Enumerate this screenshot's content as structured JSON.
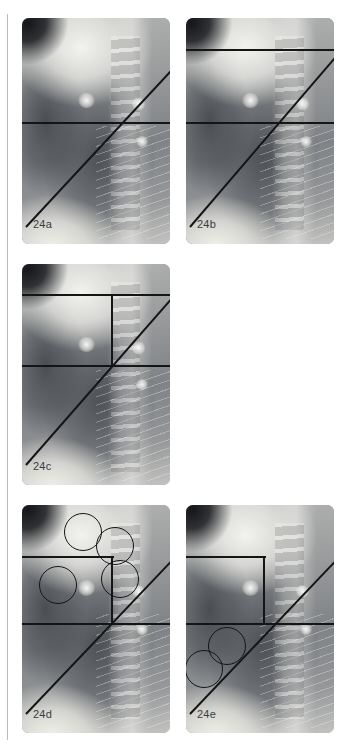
{
  "figure": {
    "type": "radiograph-annotation-series",
    "modality": "chest radiograph, lateral view",
    "panel_count": 5,
    "grid": {
      "columns": 2,
      "rows": 3
    },
    "background_color": "#ffffff",
    "annotation_color": "#151515",
    "label_color": "#3a3c3e"
  },
  "page_rule": {
    "name": "left-margin-rule",
    "color": "#b9bcbe",
    "x": 7,
    "y": 14,
    "width": 1,
    "height": 726
  },
  "panels": [
    {
      "id": "24a",
      "label": "24a",
      "x": 22,
      "y": 18,
      "width": 148,
      "height": 226,
      "label_x": 11,
      "label_y": 200,
      "annotations": {
        "horizontal_lines": [
          {
            "name": "lower-horizontal-line",
            "x1": -14,
            "y": 104,
            "x2": 162
          }
        ],
        "vertical_lines": [],
        "diagonal_lines": [
          {
            "name": "oblique-line",
            "x1": 4,
            "y1": 208,
            "x2": 160,
            "y2": 40
          }
        ],
        "circles": []
      }
    },
    {
      "id": "24b",
      "label": "24b",
      "x": 186,
      "y": 18,
      "width": 148,
      "height": 226,
      "label_x": 11,
      "label_y": 200,
      "annotations": {
        "horizontal_lines": [
          {
            "name": "upper-horizontal-line",
            "x1": -6,
            "y": 31,
            "x2": 162
          },
          {
            "name": "lower-horizontal-line",
            "x1": -6,
            "y": 104,
            "x2": 162
          }
        ],
        "vertical_lines": [],
        "diagonal_lines": [
          {
            "name": "oblique-line",
            "x1": 4,
            "y1": 208,
            "x2": 160,
            "y2": 26
          }
        ],
        "circles": []
      }
    },
    {
      "id": "24c",
      "label": "24c",
      "x": 22,
      "y": 264,
      "width": 148,
      "height": 221,
      "label_x": 11,
      "label_y": 196,
      "annotations": {
        "horizontal_lines": [
          {
            "name": "upper-horizontal-line",
            "x1": -6,
            "y": 30,
            "x2": 162
          },
          {
            "name": "lower-horizontal-line",
            "x1": -6,
            "y": 101,
            "x2": 162
          }
        ],
        "vertical_lines": [
          {
            "name": "rectangle-right-edge",
            "x": 89,
            "y1": 30,
            "y2": 103
          }
        ],
        "diagonal_lines": [
          {
            "name": "oblique-line",
            "x1": 4,
            "y1": 200,
            "x2": 158,
            "y2": 24
          }
        ],
        "circles": []
      }
    },
    {
      "id": "24d",
      "label": "24d",
      "x": 22,
      "y": 505,
      "width": 148,
      "height": 228,
      "label_x": 11,
      "label_y": 203,
      "annotations": {
        "horizontal_lines": [
          {
            "name": "rectangle-top-edge",
            "x1": -6,
            "y": 51,
            "x2": 92
          },
          {
            "name": "lower-horizontal-line",
            "x1": -6,
            "y": 118,
            "x2": 162
          }
        ],
        "vertical_lines": [
          {
            "name": "rectangle-right-edge",
            "x": 89,
            "y1": 51,
            "y2": 120
          }
        ],
        "diagonal_lines": [
          {
            "name": "oblique-line",
            "x1": 4,
            "y1": 208,
            "x2": 160,
            "y2": 44
          }
        ],
        "circles": [
          {
            "name": "roi-circle-1",
            "cx": 60,
            "cy": 26,
            "r": 18
          },
          {
            "name": "roi-circle-2",
            "cx": 92,
            "cy": 40,
            "r": 18
          },
          {
            "name": "roi-circle-3",
            "cx": 97,
            "cy": 73,
            "r": 18
          },
          {
            "name": "roi-circle-4",
            "cx": 35,
            "cy": 79,
            "r": 18
          }
        ]
      }
    },
    {
      "id": "24e",
      "label": "24e",
      "x": 186,
      "y": 505,
      "width": 148,
      "height": 228,
      "label_x": 11,
      "label_y": 203,
      "annotations": {
        "horizontal_lines": [
          {
            "name": "rectangle-top-edge",
            "x1": -6,
            "y": 51,
            "x2": 80
          },
          {
            "name": "lower-horizontal-line",
            "x1": -6,
            "y": 118,
            "x2": 162
          }
        ],
        "vertical_lines": [
          {
            "name": "rectangle-right-edge",
            "x": 77,
            "y1": 51,
            "y2": 120
          }
        ],
        "diagonal_lines": [
          {
            "name": "oblique-line",
            "x1": 4,
            "y1": 208,
            "x2": 160,
            "y2": 44
          }
        ],
        "circles": [
          {
            "name": "roi-circle-1",
            "cx": 40,
            "cy": 140,
            "r": 18
          },
          {
            "name": "roi-circle-2",
            "cx": 17,
            "cy": 163,
            "r": 18
          }
        ]
      }
    }
  ]
}
